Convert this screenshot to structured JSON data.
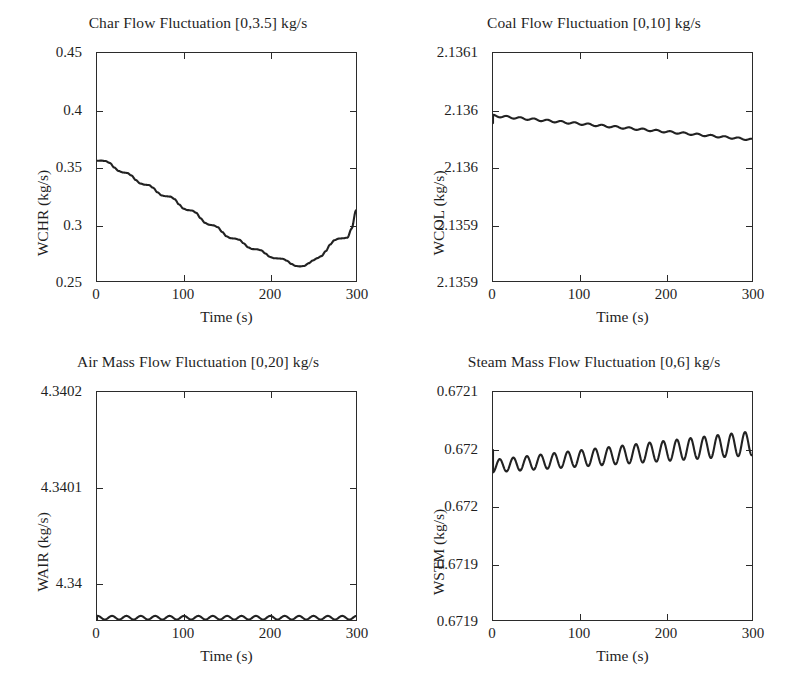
{
  "figure": {
    "xlabel": "Time (s)",
    "xticks": [
      "0",
      "100",
      "200",
      "300"
    ]
  },
  "chart_data": [
    {
      "type": "line",
      "title": "Char Flow Fluctuation [0,3.5] kg/s",
      "xlabel": "Time (s)",
      "ylabel": "WCHR (kg/s)",
      "xlim": [
        0,
        300
      ],
      "ylim": [
        0.25,
        0.45
      ],
      "xticks": [
        0,
        100,
        200,
        300
      ],
      "xticklabels": [
        "0",
        "100",
        "200",
        "300"
      ],
      "yticks": [
        0.25,
        0.3,
        0.35,
        0.4,
        0.45
      ],
      "yticklabels": [
        "0.25",
        "0.3",
        "0.35",
        "0.4",
        "0.45"
      ],
      "grid": false,
      "legend": null,
      "line_color": "#222222",
      "x": [
        0,
        5,
        10,
        15,
        20,
        25,
        30,
        35,
        40,
        45,
        50,
        55,
        60,
        65,
        70,
        75,
        80,
        85,
        90,
        95,
        100,
        105,
        110,
        115,
        120,
        125,
        130,
        135,
        140,
        145,
        150,
        155,
        160,
        165,
        170,
        175,
        180,
        185,
        190,
        195,
        200,
        205,
        210,
        215,
        220,
        225,
        230,
        235,
        240,
        245,
        250,
        255,
        260,
        265,
        270,
        275,
        280,
        285,
        290,
        295,
        300
      ],
      "y": [
        0.3555,
        0.3556,
        0.3552,
        0.3535,
        0.3495,
        0.3465,
        0.3452,
        0.3448,
        0.3425,
        0.3385,
        0.3355,
        0.3345,
        0.3342,
        0.3318,
        0.3278,
        0.325,
        0.3243,
        0.324,
        0.3218,
        0.3172,
        0.3135,
        0.3122,
        0.3118,
        0.3098,
        0.305,
        0.301,
        0.2993,
        0.2988,
        0.2972,
        0.293,
        0.2892,
        0.2875,
        0.2872,
        0.2862,
        0.283,
        0.2795,
        0.278,
        0.2778,
        0.277,
        0.2742,
        0.2712,
        0.27,
        0.2698,
        0.2695,
        0.2678,
        0.265,
        0.2632,
        0.2628,
        0.2632,
        0.2655,
        0.268,
        0.27,
        0.2718,
        0.2762,
        0.282,
        0.2858,
        0.2872,
        0.2875,
        0.288,
        0.296,
        0.312
      ]
    },
    {
      "type": "line",
      "title": "Coal Flow Fluctuation [0,10] kg/s",
      "xlabel": "Time (s)",
      "ylabel": "WCOL (kg/s)",
      "xlim": [
        0,
        300
      ],
      "ylim": [
        2.1359,
        2.1361
      ],
      "xticks": [
        0,
        100,
        200,
        300
      ],
      "xticklabels": [
        "0",
        "100",
        "200",
        "300"
      ],
      "yticks": [
        2.1359,
        2.13595,
        2.136,
        2.13605,
        2.1361
      ],
      "yticklabels": [
        "2.1359",
        "2.1359",
        "2.136",
        "2.136",
        "2.1361"
      ],
      "grid": false,
      "legend": null,
      "line_color": "#222222",
      "description": "Damped ripple oscillation, ~19 cycles, amplitude ~0.0000008, mean drifting slowly downward from 2.136045 to 2.136025",
      "mean_start": 2.136045,
      "mean_end": 2.136024,
      "amplitude": 9e-07,
      "cycles": 19
    },
    {
      "type": "line",
      "title": "Air Mass Flow Fluctuation [0,20] kg/s",
      "xlabel": "Time (s)",
      "ylabel": "WAIR (kg/s)",
      "xlim": [
        0,
        300
      ],
      "ylim": [
        4.34,
        4.3402
      ],
      "xticks": [
        0,
        100,
        200,
        300
      ],
      "xticklabels": [
        "0",
        "100",
        "200",
        "300"
      ],
      "yticks": [
        4.34,
        4.3401,
        4.3402
      ],
      "yticklabels": [
        "4.34",
        "4.3401",
        "4.3402"
      ],
      "grid": false,
      "legend": null,
      "line_color": "#222222",
      "description": "Steady constant-amplitude oscillation at the 4.34 level, ~18 cycles, no drift",
      "mean_start": 4.340002,
      "mean_end": 4.340002,
      "amplitude": 1.6e-06,
      "cycles": 18
    },
    {
      "type": "line",
      "title": "Steam Mass Flow Fluctuation [0,6] kg/s",
      "xlabel": "Time (s)",
      "ylabel": "WSTM (kg/s)",
      "xlim": [
        0,
        300
      ],
      "ylim": [
        0.6719,
        0.6721
      ],
      "xticks": [
        0,
        100,
        200,
        300
      ],
      "xticklabels": [
        "0",
        "100",
        "200",
        "300"
      ],
      "yticks": [
        0.6719,
        0.67195,
        0.672,
        0.67205,
        0.6721
      ],
      "yticklabels": [
        "0.6719",
        "0.6719",
        "0.672",
        "0.672",
        "0.6721"
      ],
      "grid": false,
      "legend": null,
      "line_color": "#222222",
      "description": "Growing-amplitude oscillation with slight upward trend, ~19 cycles",
      "mean_start": 0.672035,
      "mean_end": 0.672055,
      "amplitude_start": 5.5e-06,
      "amplitude_end": 1.05e-05,
      "cycles": 19
    }
  ]
}
